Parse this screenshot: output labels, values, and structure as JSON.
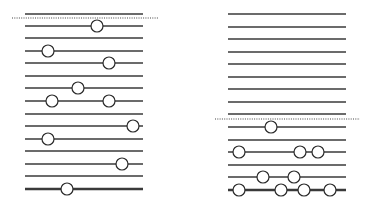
{
  "style": {
    "line_color": "#3a3a3a",
    "thin_width": 1.3,
    "thick_width": 2.6,
    "circle_radius": 6,
    "circle_fill": "#ffffff",
    "circle_stroke": "#2a2a2a",
    "dotted_color": "#444444"
  },
  "panels": [
    {
      "name": "left-panel",
      "x_start": 25,
      "x_end": 143,
      "dotted": {
        "y": 18,
        "x_start": 12,
        "x_end": 158
      },
      "lines": [
        {
          "y": 14,
          "thick": false,
          "circles": []
        },
        {
          "y": 26,
          "thick": false,
          "circles": [
            97
          ]
        },
        {
          "y": 38,
          "thick": false,
          "circles": []
        },
        {
          "y": 51,
          "thick": false,
          "circles": [
            48
          ]
        },
        {
          "y": 63,
          "thick": false,
          "circles": [
            109
          ]
        },
        {
          "y": 76,
          "thick": false,
          "circles": []
        },
        {
          "y": 88,
          "thick": false,
          "circles": [
            78
          ]
        },
        {
          "y": 101,
          "thick": false,
          "circles": [
            52,
            109
          ]
        },
        {
          "y": 114,
          "thick": false,
          "circles": []
        },
        {
          "y": 126,
          "thick": false,
          "circles": [
            133
          ]
        },
        {
          "y": 139,
          "thick": false,
          "circles": [
            48
          ]
        },
        {
          "y": 151,
          "thick": false,
          "circles": []
        },
        {
          "y": 164,
          "thick": false,
          "circles": [
            122
          ]
        },
        {
          "y": 176,
          "thick": false,
          "circles": []
        },
        {
          "y": 189,
          "thick": true,
          "circles": [
            67
          ]
        }
      ]
    },
    {
      "name": "right-panel",
      "x_start": 228,
      "x_end": 346,
      "dotted": {
        "y": 119,
        "x_start": 215,
        "x_end": 360
      },
      "lines": [
        {
          "y": 14,
          "thick": false,
          "circles": []
        },
        {
          "y": 27,
          "thick": false,
          "circles": []
        },
        {
          "y": 39,
          "thick": false,
          "circles": []
        },
        {
          "y": 52,
          "thick": false,
          "circles": []
        },
        {
          "y": 64,
          "thick": false,
          "circles": []
        },
        {
          "y": 77,
          "thick": false,
          "circles": []
        },
        {
          "y": 89,
          "thick": false,
          "circles": []
        },
        {
          "y": 102,
          "thick": false,
          "circles": []
        },
        {
          "y": 114,
          "thick": false,
          "circles": []
        },
        {
          "y": 127,
          "thick": false,
          "circles": [
            271
          ]
        },
        {
          "y": 140,
          "thick": false,
          "circles": []
        },
        {
          "y": 152,
          "thick": false,
          "circles": [
            239,
            300,
            318
          ]
        },
        {
          "y": 165,
          "thick": false,
          "circles": []
        },
        {
          "y": 177,
          "thick": false,
          "circles": [
            263,
            294
          ]
        },
        {
          "y": 190,
          "thick": true,
          "circles": [
            239,
            281,
            304,
            330
          ]
        }
      ]
    }
  ]
}
